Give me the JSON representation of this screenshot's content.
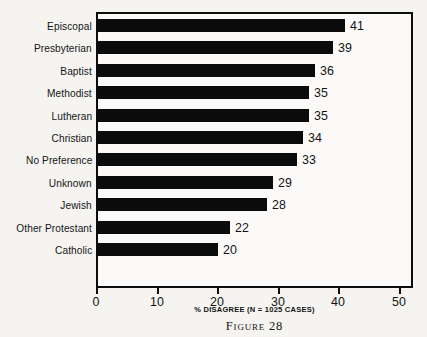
{
  "chart_data": {
    "type": "bar",
    "orientation": "horizontal",
    "title": "",
    "xlabel": "% DISAGREE (N = 1025 CASES)",
    "ylabel": "",
    "xlim": [
      0,
      54
    ],
    "xticks": [
      0,
      10,
      20,
      30,
      40,
      50
    ],
    "xtick_labels": [
      "0",
      "10",
      "20",
      "30",
      "40",
      "50"
    ],
    "grid": false,
    "legend": null,
    "categories": [
      "Episcopal",
      "Presbyterian",
      "Baptist",
      "Methodist",
      "Lutheran",
      "Christian",
      "No Preference",
      "Unknown",
      "Jewish",
      "Other Protestant",
      "Catholic"
    ],
    "values": [
      41,
      39,
      36,
      35,
      35,
      34,
      33,
      29,
      28,
      22,
      20
    ],
    "value_labels": [
      "41",
      "39",
      "36",
      "35",
      "35",
      "34",
      "33",
      "29",
      "28",
      "22",
      "20"
    ],
    "bar_color": "#0b0b0b",
    "background_color": "#f5f4f1",
    "axis_color": "#0d0d0d"
  },
  "figure": {
    "caption": "Figure 28",
    "axis_caption": "% DISAGREE (N = 1025 CASES)"
  }
}
